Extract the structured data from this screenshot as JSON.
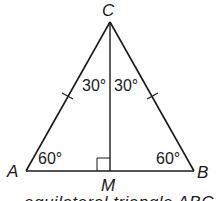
{
  "diagram": {
    "type": "geometry",
    "vertices": {
      "C": {
        "label": "C",
        "x": 110,
        "y": 22
      },
      "A": {
        "label": "A",
        "x": 26,
        "y": 171
      },
      "B": {
        "label": "B",
        "x": 194,
        "y": 171
      },
      "M": {
        "label": "M",
        "x": 110,
        "y": 171
      }
    },
    "angles": {
      "ACM": "30°",
      "BCM": "30°",
      "A": "60°",
      "B": "60°"
    },
    "marks": {
      "congruent_sides": [
        "AC",
        "BC"
      ],
      "right_angle_at": "M"
    },
    "caption_partial": "equilateral triangle ABC",
    "colors": {
      "stroke": "#1a1a1a",
      "background": "#ffffff"
    }
  }
}
